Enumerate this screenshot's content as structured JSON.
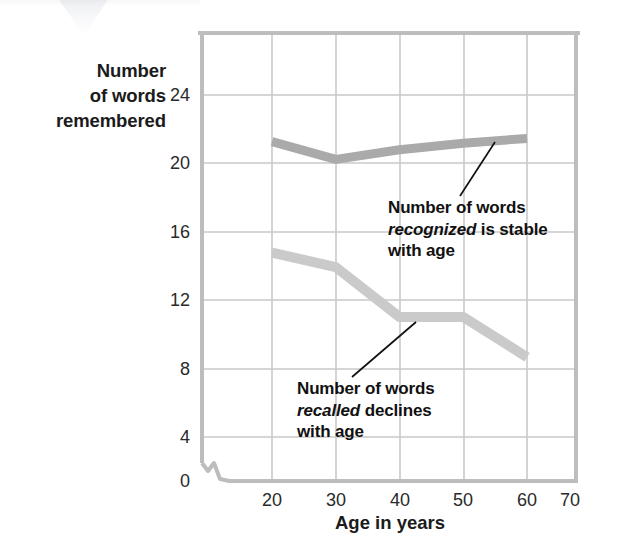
{
  "figure": {
    "y_axis_title_lines": [
      "Number",
      "of words",
      "remembered"
    ],
    "x_axis_title": "Age in years"
  },
  "annotations": {
    "recognized": {
      "line1": "Number of words",
      "line2_italic": "recognized",
      "line2_rest": " is stable",
      "line3": "with age"
    },
    "recalled": {
      "line1": "Number of words",
      "line2_italic": "recalled",
      "line2_rest": " declines",
      "line3": "with age"
    }
  },
  "chart_data": {
    "type": "line",
    "title": "",
    "subtitle": "",
    "xlabel": "Age in years",
    "ylabel": "Number of words remembered",
    "x": [
      20,
      30,
      40,
      50,
      60
    ],
    "xlim": [
      15,
      70
    ],
    "ylim": [
      0,
      26
    ],
    "xticks": [
      20,
      30,
      40,
      50,
      60,
      70
    ],
    "yticks": [
      0,
      4,
      8,
      12,
      16,
      20,
      24
    ],
    "xtick_labels": [
      "20",
      "30",
      "40",
      "50",
      "60",
      "70"
    ],
    "ytick_labels": [
      "0",
      "4",
      "8",
      "12",
      "16",
      "20",
      "24"
    ],
    "grid": true,
    "legend": "none",
    "axis_break_x": true,
    "series": [
      {
        "name": "Number of words recognized",
        "values": [
          21.1,
          20.0,
          20.6,
          21.0,
          21.3
        ],
        "color": "#a9aaa9",
        "linewidth": 9
      },
      {
        "name": "Number of words recalled",
        "values": [
          14.2,
          13.3,
          10.2,
          10.2,
          7.7
        ],
        "color": "#c9cac9",
        "linewidth": 10
      }
    ],
    "annotations": [
      {
        "series": "Number of words recognized",
        "text": "Number of words recognized is stable with age",
        "pointer_from": [
          460,
          196
        ],
        "pointer_to": [
          495,
          142
        ]
      },
      {
        "series": "Number of words recalled",
        "text": "Number of words recalled declines with age",
        "pointer_from": [
          352,
          377
        ],
        "pointer_to": [
          416,
          322
        ]
      }
    ]
  },
  "colors": {
    "recognized_line": "#a9aaa9",
    "recalled_line": "#c9cac9",
    "grid": "#c5c6c7",
    "axis": "#bdbebd",
    "text": "#1a1a1a",
    "background": "#ffffff"
  }
}
